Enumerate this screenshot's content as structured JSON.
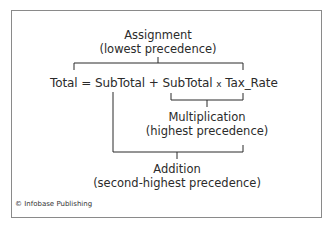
{
  "diagram": {
    "assignment": {
      "title": "Assignment",
      "subtitle": "(lowest precedence)"
    },
    "equation": {
      "lhs": "Total",
      "op_assign": "=",
      "term1": "SubTotal",
      "op_add": "+",
      "term2": "SubTotal",
      "op_mul": "x",
      "term3": "Tax_Rate"
    },
    "multiplication": {
      "title": "Multiplication",
      "subtitle": "(highest precedence)"
    },
    "addition": {
      "title": "Addition",
      "subtitle": "(second-highest precedence)"
    },
    "credit": "© Infobase Publishing"
  },
  "colors": {
    "line": "#2b2b2b",
    "border": "#8a8a8a",
    "text": "#2b2b2b"
  }
}
